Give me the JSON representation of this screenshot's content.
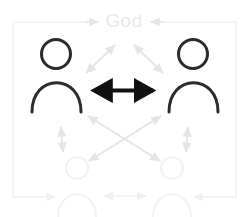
{
  "diagram": {
    "title_label": "God",
    "colors": {
      "foreground_stroke": "#2b2b2b",
      "ghost_stroke": "#f2f2f2",
      "faint_arrow": "#e6e6e6",
      "frame_line": "#f0f0f0",
      "god_text": "#e9e9e9",
      "background": "#ffffff"
    },
    "nodes": [
      {
        "id": "person-top-left",
        "label": "",
        "state": "foreground",
        "cx": 57,
        "cy": 75
      },
      {
        "id": "person-top-right",
        "label": "",
        "state": "foreground",
        "cx": 192,
        "cy": 75
      },
      {
        "id": "person-bottom-left",
        "label": "",
        "state": "ghost",
        "cx": 77,
        "cy": 190
      },
      {
        "id": "person-bottom-right",
        "label": "",
        "state": "ghost",
        "cx": 172,
        "cy": 190
      },
      {
        "id": "god",
        "label": "God",
        "state": "label",
        "cx": 124,
        "cy": 21
      }
    ],
    "connections": [
      {
        "id": "arrow-person-to-person",
        "from": "person-top-left",
        "to": "person-top-right",
        "style": "bold-bidirectional",
        "emphasis": "primary"
      },
      {
        "id": "arrow-left-person-to-god",
        "from": "person-top-left",
        "to": "god",
        "style": "faint-bidirectional",
        "emphasis": "faint"
      },
      {
        "id": "arrow-right-person-to-god",
        "from": "person-top-right",
        "to": "god",
        "style": "faint-bidirectional",
        "emphasis": "faint"
      },
      {
        "id": "arrow-frame-left-to-god",
        "from": "person-top-left",
        "to": "god",
        "style": "faint-frame-arrow",
        "emphasis": "faint"
      },
      {
        "id": "arrow-frame-right-to-god",
        "from": "person-top-right",
        "to": "god",
        "style": "faint-frame-arrow",
        "emphasis": "faint"
      },
      {
        "id": "arrow-left-cross-to-br",
        "from": "person-top-left",
        "to": "person-bottom-right",
        "style": "faint-bidirectional",
        "emphasis": "faint"
      },
      {
        "id": "arrow-right-cross-to-bl",
        "from": "person-top-right",
        "to": "person-bottom-left",
        "style": "faint-bidirectional",
        "emphasis": "faint"
      },
      {
        "id": "arrow-left-vertical-down",
        "from": "person-top-left",
        "to": "person-bottom-left",
        "style": "faint-bidirectional",
        "emphasis": "faint"
      },
      {
        "id": "arrow-right-vertical-down",
        "from": "person-top-right",
        "to": "person-bottom-right",
        "style": "faint-bidirectional",
        "emphasis": "faint"
      },
      {
        "id": "arrow-bottom-person-to-person",
        "from": "person-bottom-left",
        "to": "person-bottom-right",
        "style": "faint-bidirectional",
        "emphasis": "faint"
      },
      {
        "id": "arrow-frame-bottom-left",
        "from": "frame",
        "to": "person-bottom-left",
        "style": "faint-frame-arrow",
        "emphasis": "faint"
      },
      {
        "id": "arrow-frame-bottom-right",
        "from": "frame",
        "to": "person-bottom-right",
        "style": "faint-frame-arrow",
        "emphasis": "faint"
      }
    ]
  }
}
